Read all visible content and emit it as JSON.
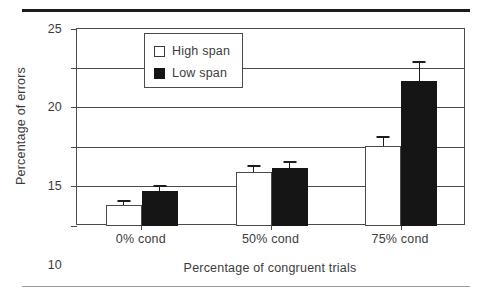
{
  "figure": {
    "has_top_rule": true,
    "has_bottom_rule": true
  },
  "chart_data": {
    "type": "bar",
    "title": "",
    "xlabel": "Percentage of congruent trials",
    "ylabel": "Percentage of errors",
    "categories": [
      "0% cond",
      "50% cond",
      "75% cond"
    ],
    "ylim": [
      0,
      25
    ],
    "yticks": [
      0,
      5,
      10,
      15,
      20,
      25
    ],
    "ytick_labels": [
      "0",
      "5",
      "10",
      "15",
      "20",
      "25"
    ],
    "grid": "horizontal",
    "legend_position": "upper-left-inside",
    "series": [
      {
        "name": "High span",
        "fill": "#ffffff",
        "edge": "#4a4a4a",
        "values": [
          2.7,
          6.8,
          10.2
        ],
        "errors": [
          0.6,
          0.9,
          1.2
        ]
      },
      {
        "name": "Low span",
        "fill": "#151515",
        "edge": "#151515",
        "values": [
          4.4,
          7.4,
          18.4
        ],
        "errors": [
          0.8,
          0.9,
          2.6
        ]
      }
    ]
  },
  "legend": {
    "entries": [
      {
        "label": "High span",
        "swatch": "open-square"
      },
      {
        "label": "Low span",
        "swatch": "filled-square"
      }
    ]
  },
  "axes": {
    "y_tick_labels": [
      "25",
      "20",
      "15",
      "10",
      "5",
      "0"
    ],
    "x_tick_labels": [
      "0% cond",
      "50% cond",
      "75% cond"
    ],
    "y_axis_title": "Percentage of errors",
    "x_axis_title": "Percentage of congruent trials"
  }
}
